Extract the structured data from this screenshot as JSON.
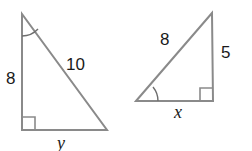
{
  "figure": {
    "background_color": "#ffffff",
    "stroke_color": "#8a8a8a",
    "text_color": "#1a1a1a",
    "triangles": [
      {
        "id": "left-triangle",
        "name": "left-triangle",
        "right_angle_at": "bottom-left",
        "marked_angle_at": "apex",
        "labels": {
          "vertical_leg": "8",
          "hypotenuse": "10",
          "horizontal_leg": "y"
        }
      },
      {
        "id": "right-triangle",
        "name": "right-triangle",
        "right_angle_at": "bottom-right",
        "marked_angle_at": "left-vertex",
        "labels": {
          "hypotenuse": "8",
          "vertical_leg": "5",
          "horizontal_leg": "x"
        }
      }
    ]
  }
}
